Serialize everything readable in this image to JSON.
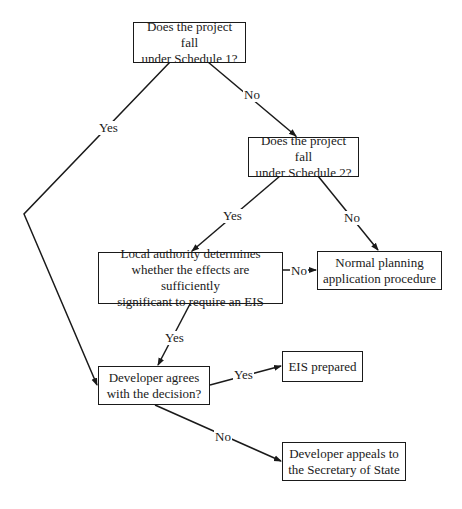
{
  "diagram": {
    "nodes": [
      {
        "id": "schedule1",
        "text": "Does the project fall\nunder Schedule 1?"
      },
      {
        "id": "schedule2",
        "text": "Does the project fall\nunder Schedule 2?"
      },
      {
        "id": "local_authority",
        "text": "Local authority determines\nwhether the effects are sufficiently\nsignificant to require an EIS"
      },
      {
        "id": "normal_planning",
        "text": "Normal planning\napplication procedure"
      },
      {
        "id": "developer_agrees",
        "text": "Developer agrees\nwith the decision?"
      },
      {
        "id": "eis_prepared",
        "text": "EIS prepared"
      },
      {
        "id": "developer_appeals",
        "text": "Developer appeals to\nthe Secretary of State"
      }
    ],
    "edges": [
      {
        "from": "schedule1",
        "to": "schedule2",
        "label": "No"
      },
      {
        "from": "schedule1",
        "to": "developer_agrees",
        "label": "Yes"
      },
      {
        "from": "schedule2",
        "to": "local_authority",
        "label": "Yes"
      },
      {
        "from": "schedule2",
        "to": "normal_planning",
        "label": "No"
      },
      {
        "from": "local_authority",
        "to": "normal_planning",
        "label": "No"
      },
      {
        "from": "local_authority",
        "to": "developer_agrees",
        "label": "Yes"
      },
      {
        "from": "developer_agrees",
        "to": "eis_prepared",
        "label": "Yes"
      },
      {
        "from": "developer_agrees",
        "to": "developer_appeals",
        "label": "No"
      }
    ]
  }
}
